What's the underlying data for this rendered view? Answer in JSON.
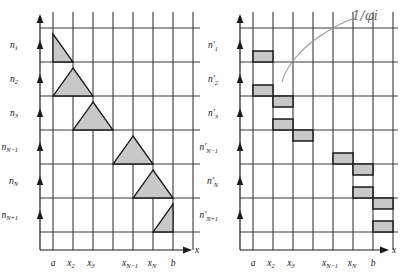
{
  "figure": {
    "title": "",
    "panels": [
      {
        "id": "left-panel",
        "name": "piecewise-linear-hat-functions",
        "x_axis_label": "x",
        "y_tick_labels": [
          "n1",
          "n2",
          "n3",
          "nN−1",
          "nN",
          "nN+1"
        ],
        "y_tick_bases": [
          "n",
          "n",
          "n",
          "n",
          "n",
          "n"
        ],
        "y_tick_subs": [
          "1",
          "2",
          "3",
          "N−1",
          "N",
          "N+1"
        ],
        "x_tick_labels": [
          "a",
          "x2",
          "x3",
          "xN−1",
          "xN",
          "b"
        ],
        "x_tick_bases": [
          "a",
          "x",
          "x",
          "x",
          "x",
          "b"
        ],
        "x_tick_subs": [
          "",
          "2",
          "3",
          "N−1",
          "N",
          ""
        ],
        "shape_type": "triangle",
        "shapes": [
          {
            "name": "hat-1",
            "row": 0,
            "kind": "right-descend",
            "x0": 1,
            "xp": 1,
            "x1": 2
          },
          {
            "name": "hat-2",
            "row": 1,
            "kind": "tent",
            "x0": 1,
            "xp": 2,
            "x1": 3
          },
          {
            "name": "hat-3",
            "row": 2,
            "kind": "tent",
            "x0": 2,
            "xp": 3,
            "x1": 4
          },
          {
            "name": "hat-N-1",
            "row": 3,
            "kind": "tent",
            "x0": 4,
            "xp": 5,
            "x1": 6
          },
          {
            "name": "hat-N",
            "row": 4,
            "kind": "tent",
            "x0": 5,
            "xp": 6,
            "x1": 7
          },
          {
            "name": "hat-N+1",
            "row": 5,
            "kind": "right-ascend",
            "x0": 6,
            "xp": 7,
            "x1": 7
          }
        ]
      },
      {
        "id": "right-panel",
        "name": "piecewise-constant-staircase-functions",
        "x_axis_label": "x",
        "y_tick_labels": [
          "n′1",
          "n′2",
          "n′3",
          "n′N−1",
          "n′N",
          "n′N+1"
        ],
        "y_tick_bases": [
          "n",
          "n",
          "n",
          "n",
          "n",
          "n"
        ],
        "y_tick_primes": [
          "′",
          "′",
          "′",
          "′",
          "′",
          "′"
        ],
        "y_tick_subs": [
          "1",
          "2",
          "3",
          "N−1",
          "N",
          "N+1"
        ],
        "x_tick_labels": [
          "a",
          "x2",
          "x3",
          "xN−1",
          "xN",
          "b"
        ],
        "x_tick_bases": [
          "a",
          "x",
          "x",
          "x",
          "x",
          "b"
        ],
        "x_tick_subs": [
          "",
          "2",
          "3",
          "N−1",
          "N",
          ""
        ],
        "shape_type": "bar",
        "shapes": [
          {
            "name": "step-1",
            "row": 0,
            "x0": 1,
            "x1": 2
          },
          {
            "name": "step-2",
            "row": 1,
            "x0": 1,
            "x1": 2
          },
          {
            "name": "step-2b",
            "row": 1,
            "x0": 2,
            "x1": 3
          },
          {
            "name": "step-3",
            "row": 2,
            "x0": 2,
            "x1": 3
          },
          {
            "name": "step-3b",
            "row": 2,
            "x0": 3,
            "x1": 4
          },
          {
            "name": "step-N-1",
            "row": 3,
            "x0": 4,
            "x1": 5
          },
          {
            "name": "step-N-1b",
            "row": 3,
            "x0": 5,
            "x1": 6
          },
          {
            "name": "step-N",
            "row": 4,
            "x0": 5,
            "x1": 6
          },
          {
            "name": "step-Nb",
            "row": 4,
            "x0": 6,
            "x1": 7
          },
          {
            "name": "step-N+1",
            "row": 5,
            "x0": 6,
            "x1": 7
          }
        ],
        "annotation": {
          "text": "1/φi",
          "name": "handwritten-annotation"
        }
      }
    ],
    "colors": {
      "fill": "#c8c8c8",
      "stroke": "#1a1a1a",
      "grid": "#3a3a3a",
      "annotation": "#6b6b6b",
      "background": "#ffffff"
    }
  }
}
